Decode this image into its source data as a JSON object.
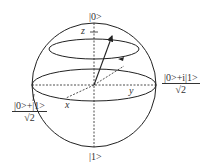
{
  "diagram": {
    "poles": {
      "top": "|0>",
      "bottom": "|1>"
    },
    "axes": {
      "z": "z",
      "x": "x",
      "y": "y"
    },
    "states": {
      "y_state": {
        "numerator": "|0>+i|1>",
        "denominator": "√2"
      },
      "x_state": {
        "numerator": "|0>+|1>",
        "denominator": "√2"
      }
    },
    "colors": {
      "line": "#222222",
      "background": "#ffffff"
    }
  }
}
